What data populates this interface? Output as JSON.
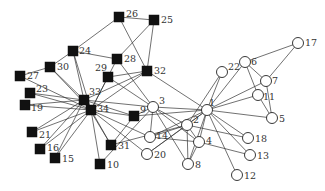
{
  "diagram": {
    "type": "network-graph",
    "colors": {
      "background": "#ffffff",
      "edge": "#333333",
      "group_a_fill": "#ffffff",
      "group_b_fill": "#111111"
    },
    "node_radius": 5.5,
    "square_size": 10,
    "nodes": [
      {
        "id": "1",
        "label": "1",
        "shape": "circle",
        "x": 207,
        "y": 110,
        "lx": 2,
        "ly": -4
      },
      {
        "id": "2",
        "label": "2",
        "shape": "circle",
        "x": 187,
        "y": 125,
        "lx": 6,
        "ly": -2
      },
      {
        "id": "3",
        "label": "3",
        "shape": "filled-circle",
        "x": 153,
        "y": 107,
        "lx": 6,
        "ly": -3
      },
      {
        "id": "4",
        "label": "4",
        "shape": "circle",
        "x": 199,
        "y": 142,
        "lx": 7,
        "ly": 2
      },
      {
        "id": "5",
        "label": "5",
        "shape": "circle",
        "x": 272,
        "y": 118,
        "lx": 7,
        "ly": 4
      },
      {
        "id": "6",
        "label": "6",
        "shape": "circle",
        "x": 245,
        "y": 62,
        "lx": 6,
        "ly": 3
      },
      {
        "id": "7",
        "label": "7",
        "shape": "circle",
        "x": 266,
        "y": 81,
        "lx": 6,
        "ly": 3
      },
      {
        "id": "8",
        "label": "8",
        "shape": "circle",
        "x": 188,
        "y": 164,
        "lx": 7,
        "ly": 4
      },
      {
        "id": "9",
        "label": "9",
        "shape": "square",
        "x": 134,
        "y": 116,
        "lx": 6,
        "ly": -3
      },
      {
        "id": "10",
        "label": "10",
        "shape": "square",
        "x": 100,
        "y": 164,
        "lx": 7,
        "ly": 4
      },
      {
        "id": "11",
        "label": "11",
        "shape": "circle",
        "x": 258,
        "y": 95,
        "lx": 5,
        "ly": 5
      },
      {
        "id": "12",
        "label": "12",
        "shape": "circle",
        "x": 237,
        "y": 175,
        "lx": 7,
        "ly": 4
      },
      {
        "id": "13",
        "label": "13",
        "shape": "circle",
        "x": 250,
        "y": 155,
        "lx": 7,
        "ly": 4
      },
      {
        "id": "14",
        "label": "14",
        "shape": "circle",
        "x": 150,
        "y": 137,
        "lx": 6,
        "ly": 2
      },
      {
        "id": "15",
        "label": "15",
        "shape": "square",
        "x": 55,
        "y": 158,
        "lx": 7,
        "ly": 4
      },
      {
        "id": "16",
        "label": "16",
        "shape": "square",
        "x": 40,
        "y": 149,
        "lx": 7,
        "ly": 2
      },
      {
        "id": "17",
        "label": "17",
        "shape": "circle",
        "x": 298,
        "y": 43,
        "lx": 7,
        "ly": 3
      },
      {
        "id": "18",
        "label": "18",
        "shape": "circle",
        "x": 248,
        "y": 138,
        "lx": 7,
        "ly": 4
      },
      {
        "id": "19",
        "label": "19",
        "shape": "square",
        "x": 25,
        "y": 105,
        "lx": 6,
        "ly": 6
      },
      {
        "id": "20",
        "label": "20",
        "shape": "circle",
        "x": 147,
        "y": 154,
        "lx": 7,
        "ly": 4
      },
      {
        "id": "21",
        "label": "21",
        "shape": "square",
        "x": 32,
        "y": 132,
        "lx": 7,
        "ly": 6
      },
      {
        "id": "22",
        "label": "22",
        "shape": "circle",
        "x": 222,
        "y": 72,
        "lx": 6,
        "ly": -2
      },
      {
        "id": "23",
        "label": "23",
        "shape": "square",
        "x": 30,
        "y": 93,
        "lx": 6,
        "ly": -1
      },
      {
        "id": "24",
        "label": "24",
        "shape": "square",
        "x": 73,
        "y": 51,
        "lx": 6,
        "ly": 3
      },
      {
        "id": "25",
        "label": "25",
        "shape": "square",
        "x": 154,
        "y": 20,
        "lx": 7,
        "ly": 3
      },
      {
        "id": "26",
        "label": "26",
        "shape": "square",
        "x": 119,
        "y": 17,
        "lx": 7,
        "ly": 0
      },
      {
        "id": "27",
        "label": "27",
        "shape": "square",
        "x": 20,
        "y": 76,
        "lx": 7,
        "ly": 3
      },
      {
        "id": "28",
        "label": "28",
        "shape": "square",
        "x": 117,
        "y": 59,
        "lx": 7,
        "ly": 3
      },
      {
        "id": "29",
        "label": "29",
        "shape": "square",
        "x": 108,
        "y": 77,
        "lx": -13,
        "ly": -6
      },
      {
        "id": "30",
        "label": "30",
        "shape": "square",
        "x": 50,
        "y": 67,
        "lx": 7,
        "ly": 3
      },
      {
        "id": "31",
        "label": "31",
        "shape": "square",
        "x": 111,
        "y": 145,
        "lx": 7,
        "ly": 4
      },
      {
        "id": "32",
        "label": "32",
        "shape": "square",
        "x": 147,
        "y": 71,
        "lx": 7,
        "ly": 3
      },
      {
        "id": "33",
        "label": "33",
        "shape": "square",
        "x": 84,
        "y": 100,
        "lx": 5,
        "ly": -5
      },
      {
        "id": "34",
        "label": "34",
        "shape": "square",
        "x": 91,
        "y": 110,
        "lx": 6,
        "ly": 2
      }
    ],
    "edges": [
      [
        "1",
        "2"
      ],
      [
        "1",
        "3"
      ],
      [
        "1",
        "4"
      ],
      [
        "1",
        "5"
      ],
      [
        "1",
        "6"
      ],
      [
        "1",
        "7"
      ],
      [
        "1",
        "8"
      ],
      [
        "1",
        "9"
      ],
      [
        "1",
        "11"
      ],
      [
        "1",
        "12"
      ],
      [
        "1",
        "13"
      ],
      [
        "1",
        "14"
      ],
      [
        "1",
        "18"
      ],
      [
        "1",
        "20"
      ],
      [
        "1",
        "22"
      ],
      [
        "1",
        "32"
      ],
      [
        "2",
        "3"
      ],
      [
        "2",
        "4"
      ],
      [
        "2",
        "8"
      ],
      [
        "2",
        "14"
      ],
      [
        "2",
        "18"
      ],
      [
        "2",
        "20"
      ],
      [
        "2",
        "22"
      ],
      [
        "2",
        "31"
      ],
      [
        "3",
        "4"
      ],
      [
        "3",
        "8"
      ],
      [
        "3",
        "9"
      ],
      [
        "3",
        "10"
      ],
      [
        "3",
        "14"
      ],
      [
        "3",
        "28"
      ],
      [
        "3",
        "29"
      ],
      [
        "3",
        "33"
      ],
      [
        "4",
        "8"
      ],
      [
        "4",
        "13"
      ],
      [
        "4",
        "14"
      ],
      [
        "5",
        "7"
      ],
      [
        "5",
        "11"
      ],
      [
        "6",
        "7"
      ],
      [
        "6",
        "11"
      ],
      [
        "6",
        "17"
      ],
      [
        "7",
        "17"
      ],
      [
        "9",
        "31"
      ],
      [
        "9",
        "33"
      ],
      [
        "9",
        "34"
      ],
      [
        "10",
        "34"
      ],
      [
        "14",
        "34"
      ],
      [
        "15",
        "33"
      ],
      [
        "15",
        "34"
      ],
      [
        "16",
        "33"
      ],
      [
        "16",
        "34"
      ],
      [
        "19",
        "33"
      ],
      [
        "19",
        "34"
      ],
      [
        "20",
        "34"
      ],
      [
        "21",
        "33"
      ],
      [
        "21",
        "34"
      ],
      [
        "23",
        "33"
      ],
      [
        "23",
        "34"
      ],
      [
        "24",
        "26"
      ],
      [
        "24",
        "28"
      ],
      [
        "24",
        "30"
      ],
      [
        "24",
        "33"
      ],
      [
        "24",
        "34"
      ],
      [
        "25",
        "26"
      ],
      [
        "25",
        "28"
      ],
      [
        "25",
        "32"
      ],
      [
        "26",
        "32"
      ],
      [
        "27",
        "30"
      ],
      [
        "27",
        "34"
      ],
      [
        "28",
        "34"
      ],
      [
        "29",
        "32"
      ],
      [
        "29",
        "34"
      ],
      [
        "30",
        "33"
      ],
      [
        "30",
        "34"
      ],
      [
        "31",
        "33"
      ],
      [
        "31",
        "34"
      ],
      [
        "32",
        "33"
      ],
      [
        "32",
        "34"
      ],
      [
        "33",
        "34"
      ]
    ]
  }
}
